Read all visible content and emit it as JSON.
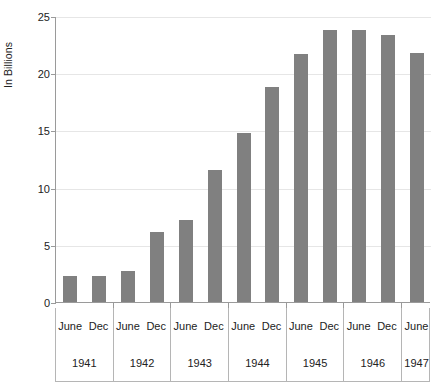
{
  "chart_data": {
    "type": "bar",
    "title": "",
    "xlabel": "",
    "ylabel": "In Billions",
    "ylim": [
      0,
      25
    ],
    "yticks": [
      0,
      5,
      10,
      15,
      20,
      25
    ],
    "ytick_labels": [
      "0",
      "5",
      "10",
      "15",
      "20",
      "25"
    ],
    "grid": true,
    "legend": null,
    "bar_color": "#808080",
    "categories": [
      "June 1941",
      "Dec 1941",
      "June 1942",
      "Dec 1942",
      "June 1943",
      "Dec 1943",
      "June 1944",
      "Dec 1944",
      "June 1945",
      "Dec 1945",
      "June 1946",
      "Dec 1946",
      "June 1947"
    ],
    "values": [
      2.3,
      2.3,
      2.7,
      6.1,
      7.2,
      11.5,
      14.8,
      18.8,
      21.7,
      23.8,
      23.8,
      23.3,
      21.8
    ],
    "year_groups": [
      {
        "year": "1941",
        "months": [
          "June",
          "Dec"
        ]
      },
      {
        "year": "1942",
        "months": [
          "June",
          "Dec"
        ]
      },
      {
        "year": "1943",
        "months": [
          "June",
          "Dec"
        ]
      },
      {
        "year": "1944",
        "months": [
          "June",
          "Dec"
        ]
      },
      {
        "year": "1945",
        "months": [
          "June",
          "Dec"
        ]
      },
      {
        "year": "1946",
        "months": [
          "June",
          "Dec"
        ]
      },
      {
        "year": "1947",
        "months": [
          "June"
        ]
      }
    ]
  }
}
